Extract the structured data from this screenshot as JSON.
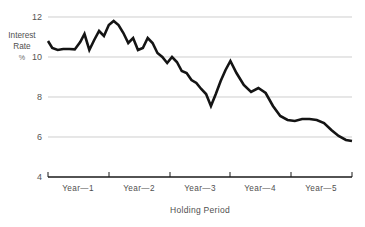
{
  "chart_data": {
    "type": "line",
    "title": "",
    "subtitle": "",
    "xlabel": "Holding Period",
    "ylabel": "Interest Rate %",
    "ylabel_lines": [
      "Interest",
      "Rate",
      "%"
    ],
    "ylim": [
      4,
      12
    ],
    "xlim": [
      0,
      5
    ],
    "yticks": [
      12,
      10,
      8,
      6,
      4
    ],
    "ytick_labels": [
      "12",
      "10",
      "8",
      "6",
      "4"
    ],
    "xtick_positions": [
      0,
      1,
      2,
      3,
      4,
      5
    ],
    "categories": [
      "Year—1",
      "Year—2",
      "Year—3",
      "Year—4",
      "Year—5"
    ],
    "grid": "horizontal",
    "legend": "none",
    "line_color": "#141414",
    "grid_color": "#b9b9b9",
    "axis_color": "#1a1a1a",
    "background_color": "#ffffff",
    "series": [
      {
        "name": "Interest Rate",
        "x": [
          0.0,
          0.07,
          0.16,
          0.25,
          0.35,
          0.44,
          0.53,
          0.6,
          0.68,
          0.76,
          0.84,
          0.92,
          1.0,
          1.08,
          1.16,
          1.24,
          1.32,
          1.4,
          1.48,
          1.56,
          1.64,
          1.72,
          1.8,
          1.88,
          1.96,
          2.04,
          2.12,
          2.2,
          2.28,
          2.36,
          2.44,
          2.52,
          2.6,
          2.68,
          2.76,
          2.84,
          2.92,
          3.0,
          3.1,
          3.22,
          3.34,
          3.46,
          3.58,
          3.7,
          3.82,
          3.94,
          4.06,
          4.18,
          4.3,
          4.42,
          4.54,
          4.66,
          4.78,
          4.9,
          5.0
        ],
        "values": [
          10.8,
          10.45,
          10.35,
          10.4,
          10.4,
          10.38,
          10.75,
          11.15,
          10.35,
          10.85,
          11.3,
          11.05,
          11.6,
          11.8,
          11.6,
          11.2,
          10.7,
          10.95,
          10.35,
          10.45,
          10.95,
          10.7,
          10.2,
          10.0,
          9.7,
          10.0,
          9.75,
          9.3,
          9.2,
          8.85,
          8.7,
          8.4,
          8.15,
          7.55,
          8.15,
          8.8,
          9.35,
          9.8,
          9.2,
          8.6,
          8.25,
          8.45,
          8.2,
          7.55,
          7.05,
          6.85,
          6.8,
          6.9,
          6.9,
          6.85,
          6.7,
          6.35,
          6.05,
          5.85,
          5.8
        ]
      }
    ]
  },
  "axes": {
    "y_label_lines": [
      "Interest",
      "Rate",
      "%"
    ],
    "x_title": "Holding Period"
  }
}
